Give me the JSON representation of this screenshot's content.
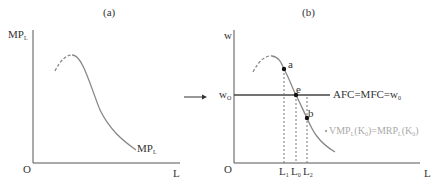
{
  "panel_a": {
    "title": "(a)",
    "y_axis": {
      "label": "MP",
      "sub": "L"
    },
    "x_axis": {
      "label": "L"
    },
    "origin": "O",
    "curve_label": {
      "main": "MP",
      "sub": "L"
    }
  },
  "arrow": "→",
  "panel_b": {
    "title": "(b)",
    "y_axis": {
      "label": "w"
    },
    "x_axis": {
      "label": "L"
    },
    "origin": "O",
    "wage_level": {
      "main": "w",
      "sub": "O"
    },
    "wage_line_label": {
      "main": "AFC=MFC=w",
      "sub": "0"
    },
    "points": [
      {
        "name": "a",
        "label": "a"
      },
      {
        "name": "e",
        "label": "e"
      },
      {
        "name": "b",
        "label": "b"
      }
    ],
    "x_ticks": [
      {
        "main": "L",
        "sub": "1"
      },
      {
        "main": "L",
        "sub": "0"
      },
      {
        "main": "L",
        "sub": "2"
      }
    ],
    "curve_label": {
      "p1": "VMP",
      "s1": "L",
      "p2": "(K",
      "s2": "0",
      "p3": ")=MRP",
      "s3": "L",
      "p4": "(K",
      "s4": "0",
      "p5": ")"
    }
  },
  "colors": {
    "axis": "#555555",
    "curve": "#8a8a8a",
    "faded_label": "#aaaaaa"
  }
}
